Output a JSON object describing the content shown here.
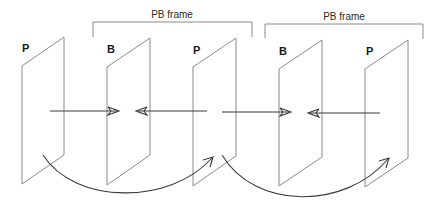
{
  "diagram": {
    "type": "video-frame-prediction",
    "frames": [
      {
        "label": "P",
        "type": "P-frame",
        "index": 0
      },
      {
        "label": "B",
        "type": "B-frame",
        "index": 1
      },
      {
        "label": "P",
        "type": "P-frame",
        "index": 2
      },
      {
        "label": "B",
        "type": "B-frame",
        "index": 3
      },
      {
        "label": "P",
        "type": "P-frame",
        "index": 4
      }
    ],
    "groups": [
      {
        "label": "PB frame",
        "spans_frames": [
          1,
          2
        ]
      },
      {
        "label": "PB frame",
        "spans_frames": [
          3,
          4
        ]
      }
    ],
    "arrows": [
      {
        "kind": "forward-prediction-to-B",
        "from_frame": 0,
        "to_frame": 1
      },
      {
        "kind": "backward-prediction-to-B",
        "from_frame": 2,
        "to_frame": 1
      },
      {
        "kind": "forward-prediction-to-B",
        "from_frame": 2,
        "to_frame": 3
      },
      {
        "kind": "backward-prediction-to-B",
        "from_frame": 4,
        "to_frame": 3
      },
      {
        "kind": "P-to-P-prediction-curve",
        "from_frame": 0,
        "to_frame": 2
      },
      {
        "kind": "P-to-P-prediction-curve",
        "from_frame": 2,
        "to_frame": 4
      }
    ],
    "colors": {
      "frame_outline": "#8a8a8a",
      "arrow": "#3a3a3a",
      "label": "#1a1a1a",
      "background": "#ffffff"
    }
  }
}
